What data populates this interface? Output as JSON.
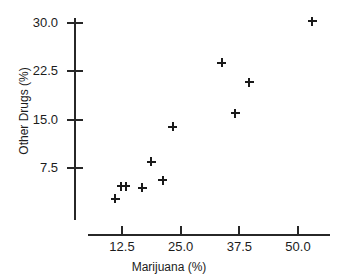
{
  "chart_data": {
    "type": "scatter",
    "title": "",
    "xlabel": "Marijuana (%)",
    "ylabel": "Other Drugs (%)",
    "xlim": [
      8.0,
      55.5
    ],
    "ylim": [
      0.0,
      31.8
    ],
    "grid": false,
    "legend": null,
    "marker": "plus",
    "marker_color": "#1a1a1a",
    "xticks": [
      12.5,
      25.0,
      37.5,
      50.0
    ],
    "xtick_labels": [
      "12.5",
      "25.0",
      "37.5",
      "50.0"
    ],
    "yticks": [
      7.5,
      15.0,
      22.5,
      30.0
    ],
    "ytick_labels": [
      "7.5",
      "15.0",
      "22.5",
      "30.0"
    ],
    "points": [
      {
        "x": 11.1,
        "y": 2.7
      },
      {
        "x": 12.3,
        "y": 4.7
      },
      {
        "x": 13.3,
        "y": 4.7
      },
      {
        "x": 16.8,
        "y": 4.4
      },
      {
        "x": 18.7,
        "y": 8.5
      },
      {
        "x": 21.2,
        "y": 5.6
      },
      {
        "x": 23.3,
        "y": 13.9
      },
      {
        "x": 33.8,
        "y": 23.8
      },
      {
        "x": 36.6,
        "y": 16.0
      },
      {
        "x": 39.6,
        "y": 20.8
      },
      {
        "x": 53.0,
        "y": 30.3
      }
    ]
  },
  "axes": {
    "y_labels": [
      "30.0",
      "22.5",
      "15.0",
      "7.5"
    ],
    "x_labels": [
      "12.5",
      "25.0",
      "37.5",
      "50.0"
    ],
    "y_title": "Other Drugs (%)",
    "x_title": "Marijuana (%)"
  },
  "title_remnant": "",
  "colors": {
    "marker": "#1a1a1a",
    "axis": "#272727",
    "text": "#1c1c1c",
    "background": "#ffffff"
  }
}
